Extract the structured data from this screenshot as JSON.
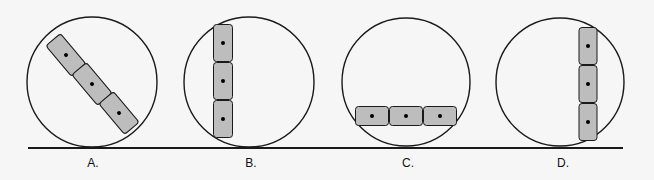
{
  "figure": {
    "colors": {
      "background": "#f6f6f6",
      "stroke": "#1a1a1a",
      "cell_fill": "#bdbdbd",
      "nucleus": "#000000"
    },
    "baseline": {
      "x1": 28,
      "x2": 623,
      "y": 148
    },
    "panels": [
      {
        "label": "A.",
        "label_x": 93,
        "circle": {
          "cx": 92,
          "cy": 82,
          "r": 65
        },
        "arrangement": "diagonal",
        "cells": [
          {
            "cx": 66,
            "cy": 55,
            "w": 40,
            "h": 19,
            "angle": 50
          },
          {
            "cx": 92,
            "cy": 84,
            "w": 40,
            "h": 19,
            "angle": 50
          },
          {
            "cx": 119,
            "cy": 113,
            "w": 40,
            "h": 19,
            "angle": 50
          }
        ]
      },
      {
        "label": "B.",
        "label_x": 251,
        "circle": {
          "cx": 249,
          "cy": 82,
          "r": 65
        },
        "arrangement": "vertical-left",
        "cells": [
          {
            "cx": 223,
            "cy": 43,
            "w": 19,
            "h": 37,
            "angle": 0
          },
          {
            "cx": 223,
            "cy": 81,
            "w": 19,
            "h": 37,
            "angle": 0
          },
          {
            "cx": 223,
            "cy": 119,
            "w": 19,
            "h": 37,
            "angle": 0
          }
        ]
      },
      {
        "label": "C.",
        "label_x": 408,
        "circle": {
          "cx": 406,
          "cy": 82,
          "r": 64
        },
        "arrangement": "horizontal-bottom",
        "cells": [
          {
            "cx": 372,
            "cy": 116,
            "w": 33,
            "h": 19,
            "angle": 0
          },
          {
            "cx": 406,
            "cy": 116,
            "w": 33,
            "h": 19,
            "angle": 0
          },
          {
            "cx": 440,
            "cy": 116,
            "w": 33,
            "h": 19,
            "angle": 0
          }
        ]
      },
      {
        "label": "D.",
        "label_x": 563,
        "circle": {
          "cx": 560,
          "cy": 82,
          "r": 64
        },
        "arrangement": "vertical-right",
        "cells": [
          {
            "cx": 588,
            "cy": 46,
            "w": 18,
            "h": 37,
            "angle": 0
          },
          {
            "cx": 588,
            "cy": 84,
            "w": 18,
            "h": 37,
            "angle": 0
          },
          {
            "cx": 588,
            "cy": 122,
            "w": 18,
            "h": 37,
            "angle": 0
          }
        ]
      }
    ]
  }
}
